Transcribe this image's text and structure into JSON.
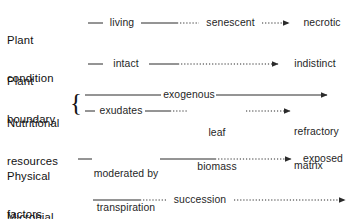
{
  "figure": {
    "background_color": "#ffffff",
    "line_color": "#2b2b2b",
    "text_color": "#111111"
  },
  "rows": [
    {
      "id": "plant-condition",
      "label": "Plant\ncondition",
      "label_line1": "Plant",
      "label_line2": "condition",
      "stages": [
        "living",
        "senescent",
        "necrotic"
      ],
      "arrow": "right-arrowhead",
      "line_style": "solid-to-dotted"
    },
    {
      "id": "plant-boundary",
      "label": "Plant\nboundary",
      "label_line1": "Plant",
      "label_line2": "boundary",
      "stages": [
        "intact",
        "indistinct"
      ],
      "arrow": "right-arrowhead",
      "line_style": "solid-to-dotted"
    },
    {
      "id": "nutritional-resources",
      "label": "Nutritional\nresources",
      "label_line1": "Nutritional",
      "label_line2": "resources",
      "brace": "{",
      "sub_rows": [
        {
          "id": "exogenous-track",
          "stages": [
            "exogenous"
          ],
          "arrow": "right-arrowhead",
          "line_style": "solid"
        },
        {
          "id": "endogenous-track",
          "stages": [
            "exudates",
            "leaf\nbiomass",
            "refractory\nmatrix"
          ],
          "stage_2_line1": "leaf",
          "stage_2_line2": "biomass",
          "stage_3_line1": "refractory",
          "stage_3_line2": "matrix",
          "arrow": "right-arrowhead",
          "line_style": "solid-to-dotted"
        }
      ]
    },
    {
      "id": "physical-factors",
      "label": "Physical\nfactors",
      "label_line1": "Physical",
      "label_line2": "factors",
      "stages": [
        "moderated by\ntranspiration",
        "exposed"
      ],
      "stage_1_line1": "moderated by",
      "stage_1_line2": "transpiration",
      "arrow": "right-arrowhead",
      "line_style": "solid-to-dotted"
    },
    {
      "id": "microbial-community",
      "label": "Microbial\ncommunity",
      "label_line1": "Microbial",
      "label_line2": "community",
      "stages": [
        "succession"
      ],
      "arrow": "right-arrowhead",
      "line_style": "solid-to-dotted"
    }
  ]
}
